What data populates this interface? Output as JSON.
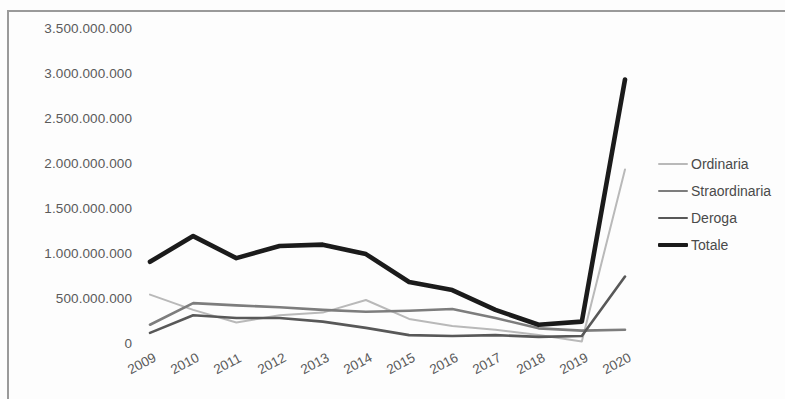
{
  "chart_data": {
    "type": "line",
    "title": "",
    "subtitle": "",
    "xlabel": "",
    "ylabel": "",
    "categories": [
      "2009",
      "2010",
      "2011",
      "2012",
      "2013",
      "2014",
      "2015",
      "2016",
      "2017",
      "2018",
      "2019",
      "2020"
    ],
    "x_tick_labels": [
      "2009",
      "2010",
      "2011",
      "2012",
      "2013",
      "2014",
      "2015",
      "2016",
      "2017",
      "2018",
      "2019",
      "2020"
    ],
    "y_tick_labels": [
      "0",
      "500.000.000",
      "1.000.000.000",
      "1.500.000.000",
      "2.000.000.000",
      "2.500.000.000",
      "3.000.000.000",
      "3.500.000.000"
    ],
    "y_tick_values": [
      0,
      500000000,
      1000000000,
      1500000000,
      2000000000,
      2500000000,
      3000000000,
      3500000000
    ],
    "ylim": [
      0,
      3500000000
    ],
    "grid": false,
    "legend_position": "right",
    "series": [
      {
        "name": "Ordinaria",
        "color": "#b9b9b9",
        "width": 2.0,
        "values": [
          560000000,
          390000000,
          250000000,
          330000000,
          360000000,
          500000000,
          290000000,
          210000000,
          170000000,
          110000000,
          40000000,
          1950000000
        ]
      },
      {
        "name": "Straordinaria",
        "color": "#7d7d7d",
        "width": 2.6,
        "values": [
          225000000,
          465000000,
          440000000,
          420000000,
          390000000,
          370000000,
          380000000,
          400000000,
          300000000,
          185000000,
          160000000,
          170000000
        ]
      },
      {
        "name": "Deroga",
        "color": "#585858",
        "width": 2.6,
        "values": [
          135000000,
          330000000,
          300000000,
          300000000,
          260000000,
          190000000,
          110000000,
          100000000,
          110000000,
          90000000,
          100000000,
          760000000
        ]
      },
      {
        "name": "Totale",
        "color": "#1b1b1b",
        "width": 4.6,
        "values": [
          925000000,
          1210000000,
          965000000,
          1100000000,
          1115000000,
          1010000000,
          700000000,
          610000000,
          390000000,
          225000000,
          260000000,
          2950000000
        ]
      }
    ]
  },
  "legend": {
    "items": [
      {
        "label": "Ordinaria"
      },
      {
        "label": "Straordinaria"
      },
      {
        "label": "Deroga"
      },
      {
        "label": "Totale"
      }
    ]
  }
}
